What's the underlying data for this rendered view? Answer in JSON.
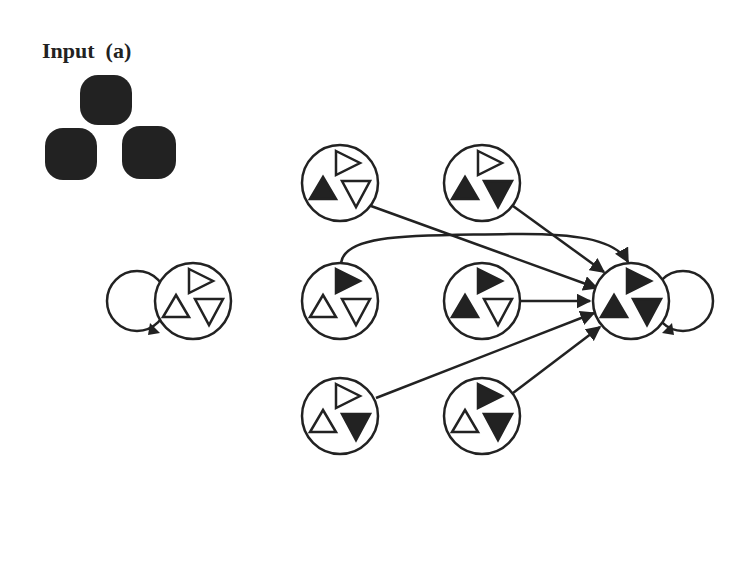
{
  "title": "Input  (a)",
  "colors": {
    "ink": "#222222",
    "background": "#ffffff"
  },
  "input_blobs": [
    {
      "x": 80,
      "y": 75,
      "w": 52,
      "h": 50
    },
    {
      "x": 45,
      "y": 128,
      "w": 52,
      "h": 52
    },
    {
      "x": 122,
      "y": 126,
      "w": 54,
      "h": 53
    }
  ],
  "nodes": [
    {
      "id": "initial",
      "cx": 193,
      "cy": 301,
      "r": 38,
      "right": "open",
      "up": "open",
      "down": "open",
      "self_loop": "left"
    },
    {
      "id": "n-r0c0",
      "cx": 340,
      "cy": 183,
      "r": 38,
      "right": "open",
      "up": "filled",
      "down": "open"
    },
    {
      "id": "n-r0c1",
      "cx": 482,
      "cy": 183,
      "r": 38,
      "right": "open",
      "up": "filled",
      "down": "filled"
    },
    {
      "id": "n-r1c0",
      "cx": 340,
      "cy": 301,
      "r": 38,
      "right": "filled",
      "up": "open",
      "down": "open"
    },
    {
      "id": "n-r1c1",
      "cx": 482,
      "cy": 301,
      "r": 38,
      "right": "filled",
      "up": "filled",
      "down": "open"
    },
    {
      "id": "n-r2c0",
      "cx": 340,
      "cy": 416,
      "r": 38,
      "right": "open",
      "up": "open",
      "down": "filled"
    },
    {
      "id": "n-r2c1",
      "cx": 482,
      "cy": 416,
      "r": 38,
      "right": "filled",
      "up": "open",
      "down": "filled"
    },
    {
      "id": "target",
      "cx": 631,
      "cy": 301,
      "r": 38,
      "right": "filled",
      "up": "filled",
      "down": "filled",
      "self_loop": "right"
    }
  ],
  "edges": [
    {
      "from": "n-r0c0",
      "path": "M371,206 L597,288"
    },
    {
      "from": "n-r0c1",
      "path": "M513,206 L604,272"
    },
    {
      "from": "n-r1c0",
      "path": "M341,263 C345,232 420,236 510,234 C570,233 615,238 628,262"
    },
    {
      "from": "n-r1c1",
      "path": "M520,301 L590,301"
    },
    {
      "from": "n-r2c0",
      "path": "M376,398 L594,313"
    },
    {
      "from": "n-r2c1",
      "path": "M513,393 L600,327"
    }
  ]
}
